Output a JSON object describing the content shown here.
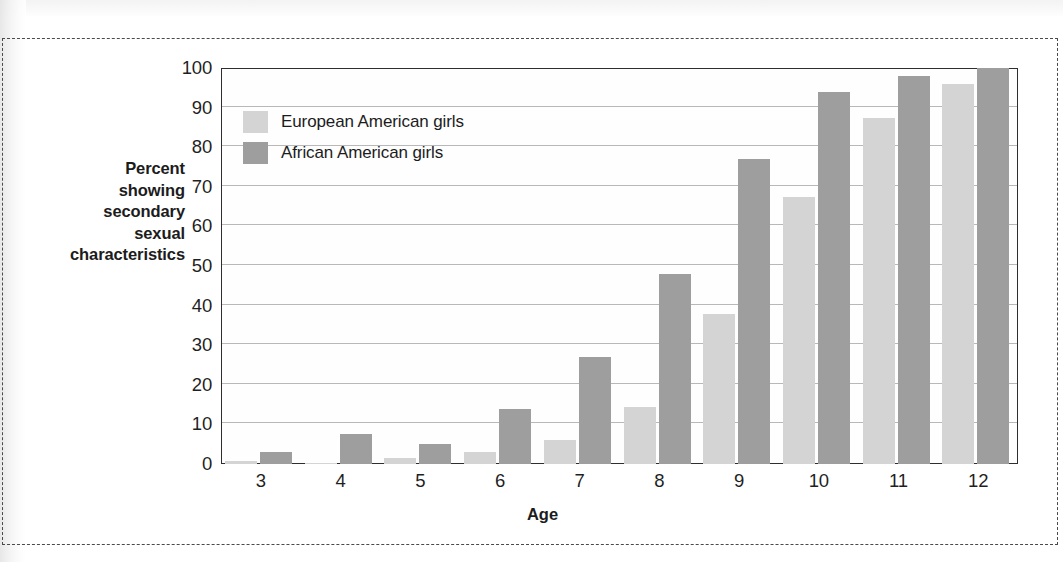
{
  "chart_data": {
    "type": "bar",
    "title": "",
    "subtitle": "",
    "xlabel": "Age",
    "ylabel": "Percent showing secondary sexual characteristics",
    "categories": [
      "3",
      "4",
      "5",
      "6",
      "7",
      "8",
      "9",
      "10",
      "11",
      "12"
    ],
    "series": [
      {
        "name": "European American girls",
        "color": "#d4d4d4",
        "values": [
          0.8,
          0.3,
          1.5,
          3.0,
          6.0,
          14.5,
          38.0,
          67.5,
          87.5,
          96.0
        ]
      },
      {
        "name": "African American girls",
        "color": "#9e9e9e",
        "values": [
          3.0,
          7.5,
          5.0,
          14.0,
          27.0,
          48.0,
          77.0,
          94.0,
          98.0,
          100.0
        ]
      }
    ],
    "ylim": [
      0,
      100
    ],
    "ytick_values": [
      "100",
      "90",
      "80",
      "70",
      "60",
      "50",
      "40",
      "30",
      "20",
      "10",
      "0"
    ],
    "ytick_step": 10,
    "grid": true,
    "grid_axis": "y",
    "legend_position": "top-left-inside"
  },
  "axis_titles": {
    "y_line1": "Percent",
    "y_line2": "showing",
    "y_line3": "secondary",
    "y_line4": "sexual",
    "y_line5": "characteristics",
    "x": "Age"
  },
  "legend": {
    "entries": [
      {
        "label": "European American girls",
        "color": "#d4d4d4"
      },
      {
        "label": "African American girls",
        "color": "#9e9e9e"
      }
    ]
  },
  "colors": {
    "series_light": "#d4d4d4",
    "series_dark": "#9e9e9e",
    "gridline": "#b8b8b8",
    "axis_frame": "#2e2e2e",
    "text": "#1c1c1c",
    "dashed_border": "#4a4a4a",
    "page_background": "#ffffff"
  }
}
